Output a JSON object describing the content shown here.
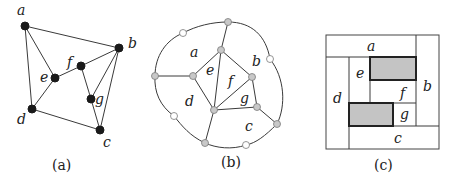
{
  "panels": [
    {
      "id": "a",
      "caption": "(a)",
      "type": "plane-graph",
      "vertices": [
        {
          "name": "a",
          "label": "a"
        },
        {
          "name": "b",
          "label": "b"
        },
        {
          "name": "c",
          "label": "c"
        },
        {
          "name": "d",
          "label": "d"
        },
        {
          "name": "e",
          "label": "e"
        },
        {
          "name": "f",
          "label": "f"
        },
        {
          "name": "g",
          "label": "g"
        }
      ],
      "edges": [
        [
          "a",
          "b"
        ],
        [
          "a",
          "e"
        ],
        [
          "a",
          "d"
        ],
        [
          "e",
          "d"
        ],
        [
          "e",
          "f"
        ],
        [
          "f",
          "b"
        ],
        [
          "f",
          "g"
        ],
        [
          "g",
          "b"
        ],
        [
          "g",
          "c"
        ],
        [
          "b",
          "c"
        ],
        [
          "d",
          "c"
        ]
      ]
    },
    {
      "id": "b",
      "caption": "(b)",
      "type": "dual-graph",
      "face_labels": [
        "a",
        "b",
        "c",
        "d",
        "e",
        "f",
        "g"
      ]
    },
    {
      "id": "c",
      "caption": "(c)",
      "type": "rectangular-dual",
      "region_labels": [
        "a",
        "b",
        "c",
        "d",
        "e",
        "f",
        "g"
      ],
      "shaded_rectangles": 2
    }
  ],
  "labels": {
    "a": "a",
    "b": "b",
    "c": "c",
    "d": "d",
    "e": "e",
    "f": "f",
    "g": "g",
    "cap_a": "(a)",
    "cap_b": "(b)",
    "cap_c": "(c)"
  },
  "colors": {
    "vertex": "#1a1a1a",
    "gray_node": "#c8c8c8",
    "shaded_rect": "#c4c4c4"
  }
}
